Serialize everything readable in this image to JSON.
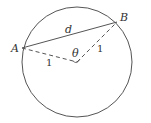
{
  "diagram": {
    "type": "circle-chord",
    "labels": {
      "point_a": "A",
      "point_b": "B",
      "chord": "d",
      "angle": "θ",
      "radius_left": "1",
      "radius_right": "1"
    },
    "colors": {
      "stroke": "#555555",
      "text": "#333333",
      "background": "#ffffff"
    },
    "geometry": {
      "center": [
        77,
        62
      ],
      "radius": 56,
      "point_a": [
        22,
        47
      ],
      "point_b": [
        117,
        22
      ]
    }
  }
}
